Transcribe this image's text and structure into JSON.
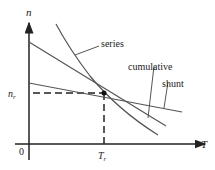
{
  "figure": {
    "y_axis_label": "n",
    "x_axis_label": "T",
    "origin_label": "0",
    "operating_speed_label": "n",
    "operating_speed_subscript": "r",
    "operating_torque_label": "T",
    "operating_torque_subscript": "r",
    "curves": [
      {
        "name": "series",
        "label": "series"
      },
      {
        "name": "cumulative",
        "label": "cumulative"
      },
      {
        "name": "shunt",
        "label": "shunt"
      }
    ],
    "colors": {
      "axis": "#222222",
      "curve": "#555555",
      "dashed": "#222222"
    }
  }
}
